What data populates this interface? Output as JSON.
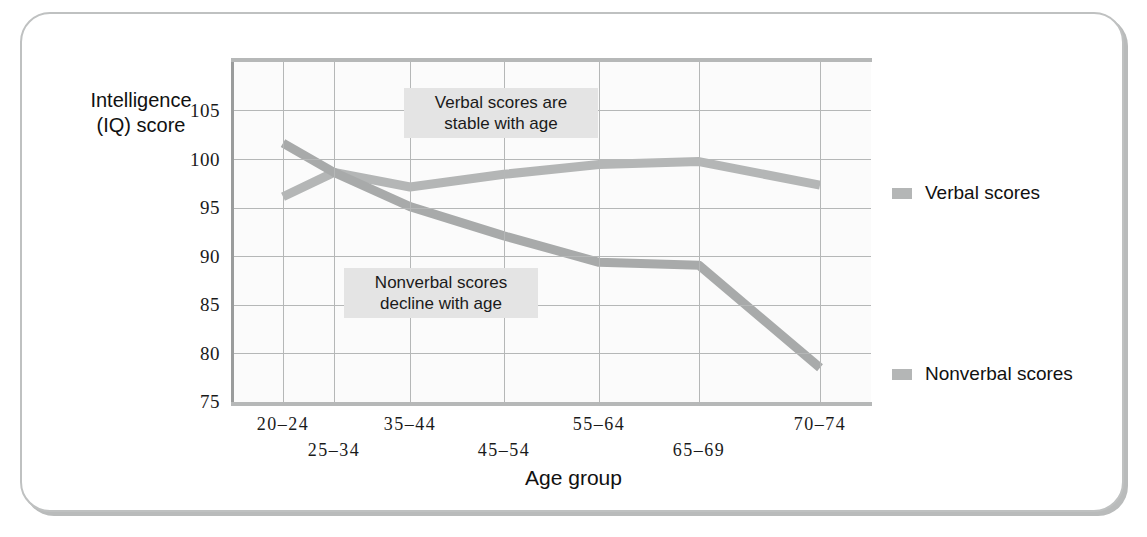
{
  "figure": {
    "background": "#ffffff",
    "frame_color": "#bfc1c1"
  },
  "axis": {
    "ylabel_line1": "Intelligence",
    "ylabel_line2": "(IQ) score",
    "xlabel": "Age group",
    "yticks": [
      "105",
      "100",
      "95",
      "90",
      "85",
      "80",
      "75"
    ],
    "xticks": [
      "20–24",
      "25–34",
      "35–44",
      "45–54",
      "55–64",
      "65–69",
      "70–74"
    ]
  },
  "annotations": {
    "verbal": "Verbal scores are\nstable with age",
    "nonverbal": "Nonverbal scores\ndecline with age"
  },
  "legend": {
    "verbal": "Verbal scores",
    "nonverbal": "Nonverbal scores",
    "swatch_color": "#b4b6b6"
  },
  "chart_data": {
    "type": "line",
    "title": "",
    "xlabel": "Age group",
    "ylabel": "Intelligence (IQ) score",
    "categories": [
      "20–24",
      "25–34",
      "35–44",
      "45–54",
      "55–64",
      "65–69",
      "70–74"
    ],
    "series": [
      {
        "name": "Verbal scores",
        "color": "#b4b6b6",
        "values": [
          96.0,
          98.5,
          97.0,
          98.3,
          99.3,
          99.6,
          97.2
        ]
      },
      {
        "name": "Nonverbal scores",
        "color": "#a8aaaa",
        "values": [
          101.5,
          98.5,
          95.0,
          92.0,
          89.3,
          89.0,
          78.5
        ]
      }
    ],
    "ylim": [
      75,
      110
    ],
    "ytick_values": [
      75,
      80,
      85,
      90,
      95,
      100,
      105
    ],
    "grid": true,
    "legend_position": "right"
  }
}
